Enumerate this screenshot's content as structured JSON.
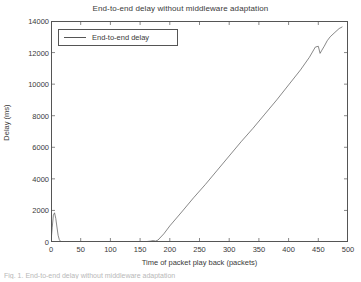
{
  "chart_data": {
    "type": "line",
    "title": "End-to-end delay without middleware adaptation",
    "xlabel": "Time of packet play back (packets)",
    "ylabel": "Delay (ms)",
    "xlim": [
      0,
      500
    ],
    "ylim": [
      0,
      14000
    ],
    "xticks": [
      0,
      50,
      100,
      150,
      200,
      250,
      300,
      350,
      400,
      450,
      500
    ],
    "yticks": [
      0,
      2000,
      4000,
      6000,
      8000,
      10000,
      12000,
      14000
    ],
    "grid": false,
    "legend_position": "upper-left",
    "line_color": "#555555",
    "series": [
      {
        "name": "End-to-end delay",
        "x": [
          0,
          2,
          4,
          6,
          8,
          10,
          12,
          14,
          16,
          20,
          30,
          50,
          80,
          110,
          140,
          160,
          168,
          172,
          176,
          180,
          190,
          200,
          220,
          240,
          260,
          280,
          300,
          320,
          340,
          360,
          380,
          400,
          420,
          435,
          445,
          450,
          453,
          456,
          460,
          465,
          470,
          478,
          485,
          490
        ],
        "y": [
          0,
          900,
          1700,
          1850,
          1500,
          950,
          420,
          150,
          40,
          10,
          5,
          5,
          5,
          5,
          10,
          25,
          60,
          90,
          60,
          120,
          520,
          1020,
          1900,
          2800,
          3650,
          4550,
          5450,
          6350,
          7200,
          8100,
          9000,
          9950,
          10900,
          11700,
          12350,
          12400,
          11950,
          12150,
          12400,
          12750,
          13000,
          13280,
          13520,
          13620
        ]
      }
    ]
  },
  "legend": {
    "entries": [
      {
        "label": "End-to-end delay"
      }
    ]
  },
  "caption": {
    "text": "Fig. 1.    End-to-end delay without middleware adaptation"
  }
}
